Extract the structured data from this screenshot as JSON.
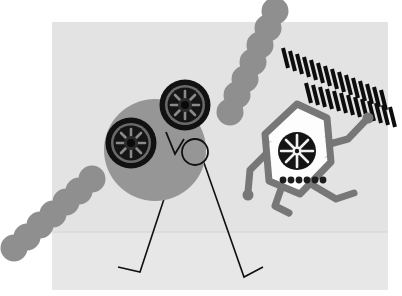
{
  "artwork": {
    "title": "Two abstract robot figures on a light gray panel",
    "canvas": {
      "width": 402,
      "height": 296,
      "background": "#ffffff"
    },
    "palette": {
      "canvas_white": "#ffffff",
      "panel_light_gray": "#e3e3e3",
      "panel_lower_gray": "#e8e8e8",
      "body_mid_gray": "#969696",
      "chain_gray": "#8f8f8f",
      "outline_gray": "#777777",
      "ink_black": "#111111",
      "face_white": "#fdfdfd",
      "horizon_line": "#d2d2d2"
    },
    "panel": {
      "label": "background-panel",
      "x": 52,
      "y": 22,
      "width": 336,
      "height": 268,
      "fill": "#e3e3e3",
      "horizon_y": 232
    },
    "round_figure": {
      "label": "round-robot",
      "body": {
        "cx": 155,
        "cy": 150,
        "r": 51,
        "fill": "#969696"
      },
      "eyes": [
        {
          "name": "left-eye-gear",
          "cx": 131,
          "cy": 143,
          "r": 25
        },
        {
          "name": "right-eye-gear",
          "cx": 185,
          "cy": 105,
          "r": 25
        }
      ],
      "nose": {
        "name": "v-nose",
        "points": "167,133 175,153 183,141"
      },
      "mouth": {
        "name": "o-mouth",
        "cx": 195,
        "cy": 152,
        "r": 13
      },
      "legs": [
        {
          "name": "left-leg",
          "points": "163,200 139,272 118,268"
        },
        {
          "name": "right-leg",
          "points": "205,162 243,276 262,268"
        }
      ]
    },
    "hex_figure": {
      "label": "hexagon-robot",
      "head": {
        "name": "hexagon-head",
        "points": "297,105 326,118 330,163 300,194 268,182 264,135",
        "stroke": "#777777",
        "fill": "#fdfdfd",
        "stroke_width": 7
      },
      "gear_face": {
        "name": "face-gear",
        "cx": 297,
        "cy": 151,
        "r": 19
      },
      "teeth_dots": {
        "name": "teeth-dot-row",
        "count": 6,
        "cy": 180,
        "start_x": 283,
        "spacing": 8,
        "r": 3.4,
        "fill": "#1c1c1c"
      },
      "side_eyes": [
        {
          "name": "left-side-eye",
          "cx": 266,
          "cy": 152
        },
        {
          "name": "right-side-eye",
          "cx": 330,
          "cy": 147
        }
      ],
      "arms": [
        {
          "name": "left-arm",
          "points": "268,155 249,172 246,195"
        },
        {
          "name": "right-arm",
          "points": "328,150 349,140 366,118"
        }
      ],
      "legs": [
        {
          "name": "left-leg",
          "points": "281,190 274,213 287,216"
        },
        {
          "name": "right-leg",
          "points": "313,190 336,203 353,196"
        }
      ]
    },
    "chains": [
      {
        "name": "lower-left-chain",
        "circle_count": 7,
        "radius": 13.5,
        "fill": "#8f8f8f",
        "from": {
          "x": 14,
          "y": 248
        },
        "to": {
          "x": 92,
          "y": 179
        }
      },
      {
        "name": "upper-right-chain",
        "circle_count": 7,
        "radius": 13.5,
        "fill": "#8f8f8f",
        "from": {
          "x": 230,
          "y": 112
        },
        "to": {
          "x": 275,
          "y": 11
        }
      }
    ],
    "dash_pattern": {
      "name": "chevron-dash-burst",
      "description": "Two converging rows of slanted black dashes",
      "dash_color": "#0d0d0d",
      "dash_width": 4,
      "row_a_count": 15,
      "row_b_count": 15,
      "apex": {
        "x": 381,
        "y": 102
      },
      "row_a_start": {
        "x": 285,
        "y": 48
      },
      "row_b_start": {
        "x": 309,
        "y": 86
      }
    }
  }
}
